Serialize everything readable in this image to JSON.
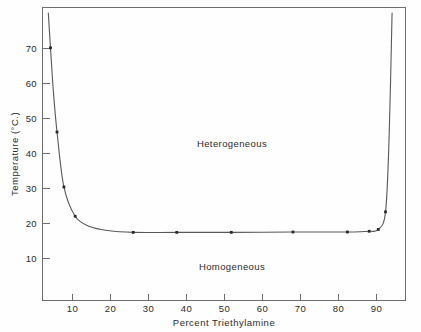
{
  "chart_data": {
    "type": "line",
    "title": "",
    "subtitle": "",
    "xlabel": "Percent Triethylamine",
    "ylabel": "Temperature (°C.)",
    "xlim": [
      0,
      100
    ],
    "ylim": [
      0,
      80
    ],
    "xticks": [
      10,
      20,
      30,
      40,
      50,
      60,
      70,
      80,
      90
    ],
    "xticklabels": [
      "10",
      "20",
      "30",
      "40",
      "50",
      "60",
      "70",
      "80",
      "90"
    ],
    "yticks": [
      10,
      20,
      30,
      40,
      50,
      60,
      70
    ],
    "yticklabels": [
      "10",
      "20",
      "30",
      "40",
      "50",
      "60",
      "70"
    ],
    "grid": false,
    "legend": null,
    "annotations": [
      {
        "text": "Heterogeneous",
        "x": 47,
        "y": 43
      },
      {
        "text": "Homogeneous",
        "x": 45,
        "y": 11.5
      }
    ],
    "series": [
      {
        "name": "Solubility curve (binodal)",
        "x": [
          1.6,
          2.2,
          3.0,
          4.0,
          5.9,
          9.0,
          13.0,
          18.0,
          25.0,
          37.0,
          52.0,
          69.0,
          84.0,
          90.0,
          92.5,
          94.5,
          95.5,
          96.3
        ],
        "y": [
          78.5,
          69.0,
          57.0,
          46.0,
          31.0,
          23.0,
          20.2,
          19.1,
          18.6,
          18.6,
          18.6,
          18.7,
          18.7,
          18.9,
          19.4,
          24.2,
          45.0,
          78.5
        ],
        "marker_x": [
          2.2,
          4.0,
          5.9,
          9.0,
          25.0,
          37.0,
          52.0,
          69.0,
          84.0,
          90.0,
          92.5,
          94.5
        ],
        "marker_y": [
          69.0,
          46.0,
          31.0,
          23.0,
          18.6,
          18.6,
          18.6,
          18.7,
          18.7,
          18.9,
          19.4,
          24.2
        ]
      }
    ],
    "curve_color": "#585858",
    "marker_color": "#2a2a2a",
    "axis_color": "#6e6e6e",
    "background_color": "#fefefe"
  },
  "figure": {
    "caption": "",
    "xlabel": "Percent Triethylamine",
    "ylabel": "Temperature (°C.)",
    "region_upper": "Heterogeneous",
    "region_lower": "Homogeneous"
  },
  "axis": {
    "x_tick_labels": [
      "10",
      "20",
      "30",
      "40",
      "50",
      "60",
      "70",
      "80",
      "90"
    ],
    "y_tick_labels": [
      "70",
      "60",
      "50",
      "40",
      "30",
      "20",
      "10"
    ]
  }
}
